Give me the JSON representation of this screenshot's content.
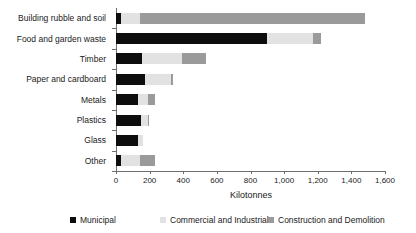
{
  "chart_data": {
    "type": "bar",
    "orientation": "horizontal",
    "stacked": true,
    "title": "",
    "xlabel": "Kilotonnes",
    "ylabel": "",
    "xlim": [
      0,
      1600
    ],
    "xticks": [
      0,
      200,
      400,
      600,
      800,
      1000,
      1200,
      1400,
      1600
    ],
    "xtick_labels": [
      "0",
      "200",
      "400",
      "600",
      "800",
      "1,000",
      "1,200",
      "1,400",
      "1,600"
    ],
    "grid": false,
    "legend_position": "bottom",
    "categories": [
      "Building rubble and soil",
      "Food and garden waste",
      "Timber",
      "Paper and cardboard",
      "Metals",
      "Plastics",
      "Glass",
      "Other"
    ],
    "series": [
      {
        "name": "Municipal",
        "color": "#0d0d0d",
        "values": [
          30,
          900,
          155,
          170,
          130,
          150,
          130,
          30
        ]
      },
      {
        "name": "Commercial and Industrial",
        "color": "#e2e2e2",
        "values": [
          110,
          270,
          240,
          160,
          60,
          40,
          30,
          110
        ]
      },
      {
        "name": "Construction and Demolition",
        "color": "#9a9a9a",
        "values": [
          1340,
          50,
          140,
          10,
          40,
          5,
          0,
          90
        ]
      }
    ],
    "totals": [
      1480,
      1220,
      535,
      340,
      230,
      195,
      160,
      230
    ]
  },
  "legend": {
    "items": [
      {
        "label": "Municipal",
        "swatch": "municipal"
      },
      {
        "label": "Commercial and Industrial",
        "swatch": "commercial"
      },
      {
        "label": "Construction and Demolition",
        "swatch": "construction"
      }
    ]
  },
  "colors": {
    "municipal": "#0d0d0d",
    "commercial": "#e2e2e2",
    "construction": "#9a9a9a",
    "axis": "#6e6e6e",
    "text": "#1a1a1a",
    "background": "#ffffff"
  }
}
